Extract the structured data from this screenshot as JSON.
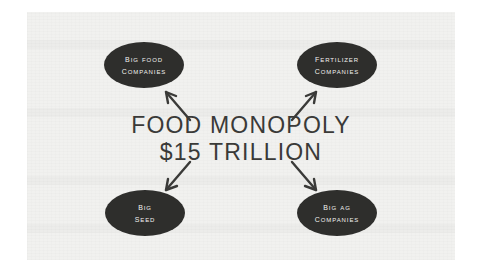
{
  "diagram": {
    "type": "hub-and-spoke",
    "center": {
      "line1": "FOOD MONOPOLY",
      "line2": "$15 TRILLION"
    },
    "nodes": [
      {
        "id": "big-food-companies",
        "line1": "Big Food",
        "line2": "Companies",
        "position": "top-left"
      },
      {
        "id": "fertilizer-companies",
        "line1": "Fertilizer",
        "line2": "Companies",
        "position": "top-right"
      },
      {
        "id": "big-seed",
        "line1": "Big",
        "line2": "Seed",
        "position": "bottom-left"
      },
      {
        "id": "big-ag-companies",
        "line1": "Big Ag",
        "line2": "Companies",
        "position": "bottom-right"
      }
    ],
    "arrows": [
      {
        "id": "arrow-to-big-food",
        "direction": "up-left",
        "from": "center",
        "to": "big-food-companies"
      },
      {
        "id": "arrow-to-fertilizer",
        "direction": "up-right",
        "from": "center",
        "to": "fertilizer-companies"
      },
      {
        "id": "arrow-to-big-seed",
        "direction": "down-left",
        "from": "center",
        "to": "big-seed"
      },
      {
        "id": "arrow-to-big-ag",
        "direction": "down-right",
        "from": "center",
        "to": "big-ag-companies"
      }
    ],
    "colors": {
      "node_fill": "#2e2e2c",
      "node_text": "#f2f2f0",
      "center_text": "#3a3a38",
      "page_background": "#f1f1ef",
      "canvas_background": "#ffffff",
      "arrow_stroke": "#3a3a38"
    }
  }
}
